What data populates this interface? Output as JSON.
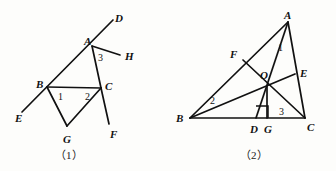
{
  "document": {
    "type": "geometry-figure-pair",
    "background_color": "#fdfdfb",
    "ink_color": "#111111"
  },
  "figures": [
    {
      "id": "figure-1",
      "caption": "（1）",
      "description": "Transversal line E-B-A-D crossing segment BC, with cevians to G and ray AH and segment CF",
      "points": [
        {
          "name": "D",
          "label": "D",
          "x": 115,
          "y": 13,
          "vx": 111,
          "vy": 21
        },
        {
          "name": "A",
          "label": "A",
          "x": 84,
          "y": 36,
          "vx": 92,
          "vy": 46
        },
        {
          "name": "H",
          "label": "H",
          "x": 125,
          "y": 51,
          "vx": 120,
          "vy": 55
        },
        {
          "name": "B",
          "label": "B",
          "x": 36,
          "y": 79,
          "vx": 47,
          "vy": 87
        },
        {
          "name": "C",
          "label": "C",
          "x": 105,
          "y": 81,
          "vx": 101,
          "vy": 88
        },
        {
          "name": "E",
          "label": "E",
          "x": 15,
          "y": 113,
          "vx": 25,
          "vy": 113
        },
        {
          "name": "G",
          "label": "G",
          "x": 63,
          "y": 134,
          "vx": 67,
          "vy": 127
        },
        {
          "name": "F",
          "label": "F",
          "x": 110,
          "y": 129,
          "vx": 109,
          "vy": 124
        }
      ],
      "angles": [
        {
          "label": "1",
          "x": 58,
          "y": 92
        },
        {
          "label": "2",
          "x": 85,
          "y": 92
        },
        {
          "label": "3",
          "x": 98,
          "y": 53
        }
      ],
      "segments": [
        {
          "from": "E",
          "to": "D",
          "note": "line EBAD through B and A"
        },
        {
          "from": "A",
          "to": "H",
          "note": "ray AH"
        },
        {
          "from": "A",
          "to": "C",
          "note": "side AC"
        },
        {
          "from": "B",
          "to": "C",
          "note": "segment BC"
        },
        {
          "from": "B",
          "to": "G",
          "note": "segment BG"
        },
        {
          "from": "G",
          "to": "C",
          "note": "segment GC"
        },
        {
          "from": "C",
          "to": "F",
          "note": "segment CF extended"
        }
      ]
    },
    {
      "id": "figure-2",
      "caption": "（2）",
      "description": "Triangle ABC with cevians AD, BE, CF meeting at O; AD perpendicular to BC at D, G on BC",
      "points": [
        {
          "name": "A",
          "label": "A",
          "x": 116,
          "y": 10,
          "vx": 120,
          "vy": 22
        },
        {
          "name": "F",
          "label": "F",
          "x": 66,
          "y": 50,
          "vx": 75,
          "vy": 60
        },
        {
          "name": "E",
          "label": "E",
          "x": 132,
          "y": 68,
          "vx": 127,
          "vy": 74
        },
        {
          "name": "O",
          "label": "O",
          "x": 94,
          "y": 71,
          "vx": 99,
          "vy": 86
        },
        {
          "name": "B",
          "label": "B",
          "x": 8,
          "y": 113,
          "vx": 22,
          "vy": 118
        },
        {
          "name": "D",
          "label": "D",
          "x": 82,
          "y": 124,
          "vx": 88,
          "vy": 118
        },
        {
          "name": "G",
          "label": "G",
          "x": 96,
          "y": 124,
          "vx": 99,
          "vy": 118
        },
        {
          "name": "C",
          "label": "C",
          "x": 139,
          "y": 122,
          "vx": 137,
          "vy": 118
        }
      ],
      "angles": [
        {
          "label": "1",
          "x": 110,
          "y": 43
        },
        {
          "label": "2",
          "x": 42,
          "y": 96
        },
        {
          "label": "3",
          "x": 111,
          "y": 107
        }
      ],
      "right_angle": {
        "at": "D",
        "x": 95,
        "y": 103,
        "size": 12
      },
      "segments": [
        {
          "from": "B",
          "to": "C",
          "note": "base BC"
        },
        {
          "from": "A",
          "to": "B",
          "note": "side AB through F"
        },
        {
          "from": "A",
          "to": "C",
          "note": "side AC through E"
        },
        {
          "from": "A",
          "to": "D",
          "note": "altitude AD through O"
        },
        {
          "from": "B",
          "to": "E",
          "note": "cevian BE through O"
        },
        {
          "from": "C",
          "to": "F",
          "note": "cevian CF through O"
        },
        {
          "from": "O",
          "to": "G",
          "note": "segment OG"
        },
        {
          "from": "A",
          "to": "G",
          "note": "segment AG"
        }
      ]
    }
  ]
}
